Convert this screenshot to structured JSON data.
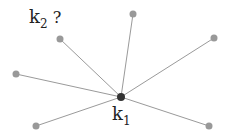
{
  "diagram": {
    "center": {
      "id": "k1",
      "x": 121,
      "y": 97,
      "label": "k",
      "sub": "1"
    },
    "query_label": {
      "label": "k",
      "sub": "2",
      "suffix": " ?"
    },
    "nodes": [
      {
        "x": 133,
        "y": 14
      },
      {
        "x": 214,
        "y": 38
      },
      {
        "x": 60,
        "y": 39
      },
      {
        "x": 16,
        "y": 74
      },
      {
        "x": 36,
        "y": 126
      },
      {
        "x": 209,
        "y": 126
      }
    ],
    "colors": {
      "edge": "#9a9a9a",
      "node": "#999999",
      "center": "#333333"
    }
  }
}
